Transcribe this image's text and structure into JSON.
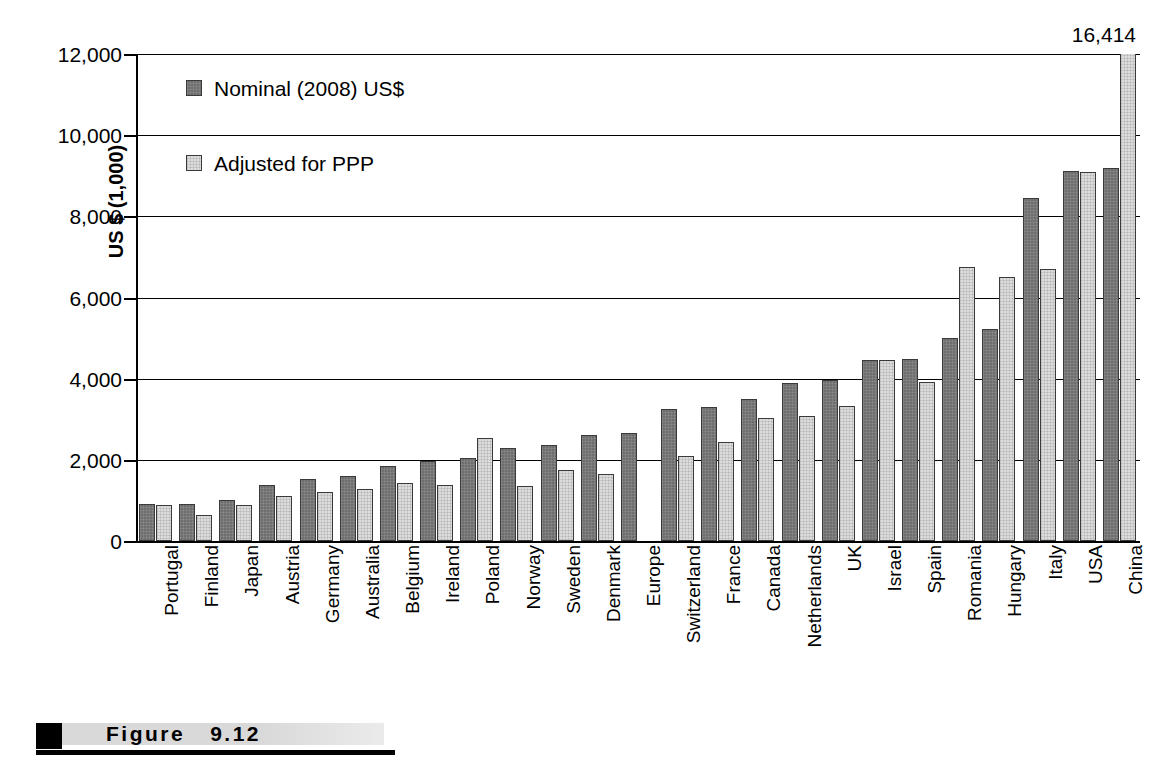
{
  "figure": {
    "caption_label": "Figure",
    "caption_number": "9.12",
    "overflow_annotation": "16,414"
  },
  "legend": {
    "items": [
      {
        "label": "Nominal (2008) US$",
        "key": "nominal",
        "color": "#6e6e6e"
      },
      {
        "label": "Adjusted for PPP",
        "key": "ppp",
        "color": "#dcdcdc"
      }
    ]
  },
  "chart_data": {
    "type": "bar",
    "title": "",
    "xlabel": "",
    "ylabel": "US $ (1,000)",
    "ylim": [
      0,
      12000
    ],
    "yticks": [
      0,
      2000,
      4000,
      6000,
      8000,
      10000,
      12000
    ],
    "ytick_labels": [
      "0",
      "2,000",
      "4,000",
      "6,000",
      "8,000",
      "10,000",
      "12,000"
    ],
    "grid": true,
    "legend_position": "upper-left-inside",
    "annotations": [
      {
        "text": "16,414",
        "category": "China",
        "series": "Adjusted for PPP",
        "note": "bar clipped above axis maximum"
      }
    ],
    "categories": [
      "Portugal",
      "Finland",
      "Japan",
      "Austria",
      "Germany",
      "Australia",
      "Belgium",
      "Ireland",
      "Poland",
      "Norway",
      "Sweden",
      "Denmark",
      "Europe",
      "Switzerland",
      "France",
      "Canada",
      "Netherlands",
      "UK",
      "Israel",
      "Spain",
      "Romania",
      "Hungary",
      "Italy",
      "USA",
      "China"
    ],
    "series": [
      {
        "name": "Nominal (2008) US$",
        "values": [
          900,
          910,
          1020,
          1370,
          1520,
          1600,
          1840,
          1980,
          2050,
          2280,
          2370,
          2610,
          2670,
          3250,
          3300,
          3500,
          3900,
          3960,
          4460,
          4490,
          5010,
          5220,
          8450,
          9110,
          9200
        ]
      },
      {
        "name": "Adjusted for PPP",
        "values": [
          880,
          640,
          890,
          1100,
          1210,
          1270,
          1430,
          1380,
          2540,
          1360,
          1740,
          1650,
          null,
          2100,
          2450,
          3030,
          3080,
          3330,
          4470,
          3920,
          6740,
          6500,
          6700,
          9100,
          16414
        ]
      }
    ]
  }
}
